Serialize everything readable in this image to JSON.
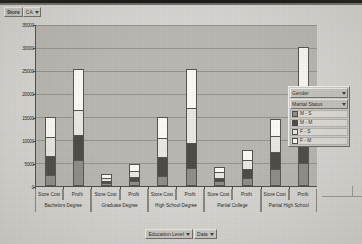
{
  "window": {
    "title": "Education Level Store Cost / Profit by Gender and Marital Status"
  },
  "top_toolbar": {
    "dimension_label": "Store",
    "dimension_value": "CA",
    "dropdown_icon": "chevron-down-icon"
  },
  "bottom_toolbar": {
    "buttons": [
      {
        "label": "Education Level",
        "icon": "chevron-down-icon"
      },
      {
        "label": "Data",
        "icon": "chevron-down-icon"
      }
    ]
  },
  "legend": {
    "dropdowns": [
      {
        "label": "Gender",
        "icon": "chevron-down-icon"
      },
      {
        "label": "Marital Status",
        "icon": "chevron-down-icon"
      }
    ],
    "items": [
      {
        "label": "M - S",
        "color": "#8f8d88"
      },
      {
        "label": "M - M",
        "color": "#4c4a47"
      },
      {
        "label": "F - S",
        "color": "#e9e8e4"
      },
      {
        "label": "F - M",
        "color": "#fbfaf7"
      }
    ]
  },
  "chart_data": {
    "type": "bar",
    "stacked": true,
    "title": "",
    "xlabel": "Education Level",
    "ylabel": "",
    "ylim": [
      0,
      35000
    ],
    "yticks": [
      0,
      5000,
      10000,
      15000,
      20000,
      25000,
      30000,
      35000
    ],
    "ytick_labels": [
      "0",
      "5000",
      "10000",
      "15000",
      "20000",
      "25000",
      "30000",
      "35000"
    ],
    "grid": true,
    "legend_position": "right",
    "measures": [
      "Store Cost",
      "Profit"
    ],
    "categories": [
      "Bachelors Degree",
      "Graduate Degree",
      "High School Degree",
      "Partial College",
      "Partial High School"
    ],
    "series": [
      {
        "name": "M - S",
        "color": "#8f8d88"
      },
      {
        "name": "M - M",
        "color": "#4c4a47"
      },
      {
        "name": "F - S",
        "color": "#e9e8e4"
      },
      {
        "name": "F - M",
        "color": "#fbfaf7"
      }
    ],
    "bars": [
      {
        "category": "Bachelors Degree",
        "measure": "Store Cost",
        "values": [
          2100,
          4200,
          4200,
          4500
        ],
        "total": 15000
      },
      {
        "category": "Bachelors Degree",
        "measure": "Profit",
        "values": [
          5400,
          5400,
          5400,
          9000
        ],
        "total": 25200
      },
      {
        "category": "Graduate Degree",
        "measure": "Store Cost",
        "values": [
          500,
          400,
          800,
          800
        ],
        "total": 2500
      },
      {
        "category": "Graduate Degree",
        "measure": "Profit",
        "values": [
          900,
          900,
          1400,
          1600
        ],
        "total": 4800
      },
      {
        "category": "High School Degree",
        "measure": "Store Cost",
        "values": [
          1800,
          4200,
          4200,
          4800
        ],
        "total": 15000
      },
      {
        "category": "High School Degree",
        "measure": "Profit",
        "values": [
          3600,
          5400,
          7800,
          8400
        ],
        "total": 25200
      },
      {
        "category": "Partial College",
        "measure": "Store Cost",
        "values": [
          900,
          700,
          1300,
          1300
        ],
        "total": 4200
      },
      {
        "category": "Partial College",
        "measure": "Profit",
        "values": [
          1500,
          1900,
          2100,
          2300
        ],
        "total": 7800
      },
      {
        "category": "Partial High School",
        "measure": "Store Cost",
        "values": [
          3600,
          3600,
          3600,
          3600
        ],
        "total": 14400
      },
      {
        "category": "Partial High School",
        "measure": "Profit",
        "values": [
          4800,
          6000,
          9000,
          10200
        ],
        "total": 30000
      }
    ]
  }
}
